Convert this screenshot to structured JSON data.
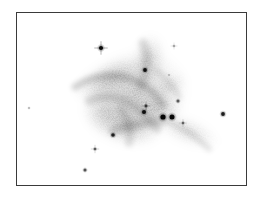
{
  "figure": {
    "kind": "astronomical-plate",
    "rendering": "inverted-grayscale",
    "background_color": "#ffffff",
    "ink_color": "#000000",
    "frame": {
      "border_color": "#3a3a3a",
      "shadow_color": "#8a8a8a",
      "x": 16,
      "y": 12,
      "width": 231,
      "height": 174
    }
  },
  "chart_data": {
    "type": "scatter",
    "title": "",
    "subtitle": "",
    "xlabel": "",
    "ylabel": "",
    "grid": false,
    "legend": null,
    "axis_visible": false,
    "tick_labels": [],
    "xlim": [
      0,
      231
    ],
    "ylim": [
      0,
      174
    ],
    "colormap": "grayscale-inverted",
    "note": "Diffuse nebulosity plus discrete point sources on a photographic plate; darker ink = brighter sky flux.",
    "series": [
      {
        "name": "point-sources",
        "marker": "filled-dot",
        "points": [
          {
            "id": "s01",
            "x": 84,
            "y": 35,
            "r": 2.1,
            "darkness": 0.92,
            "spikes": true,
            "label": "star-upper-left"
          },
          {
            "id": "s02",
            "x": 157,
            "y": 33,
            "r": 1.1,
            "darkness": 0.28,
            "spikes": true,
            "label": "star-upper-right-faint"
          },
          {
            "id": "s03",
            "x": 128,
            "y": 57,
            "r": 1.9,
            "darkness": 0.9,
            "spikes": false,
            "label": "star-upper-mid"
          },
          {
            "id": "s04",
            "x": 129,
            "y": 93,
            "r": 1.4,
            "darkness": 0.6,
            "spikes": true,
            "label": "star-core-a"
          },
          {
            "id": "s05",
            "x": 127,
            "y": 99,
            "r": 2.0,
            "darkness": 0.9,
            "spikes": false,
            "label": "star-core-b"
          },
          {
            "id": "s06",
            "x": 146,
            "y": 104,
            "r": 2.6,
            "darkness": 0.96,
            "spikes": false,
            "label": "star-bright-pair-left"
          },
          {
            "id": "s07",
            "x": 155,
            "y": 104,
            "r": 2.5,
            "darkness": 0.95,
            "spikes": false,
            "label": "star-bright-pair-right"
          },
          {
            "id": "s08",
            "x": 166,
            "y": 110,
            "r": 1.2,
            "darkness": 0.45,
            "spikes": true,
            "label": "star-right-of-pair"
          },
          {
            "id": "s09",
            "x": 161,
            "y": 88,
            "r": 1.5,
            "darkness": 0.55,
            "spikes": false,
            "label": "star-mid-right"
          },
          {
            "id": "s10",
            "x": 206,
            "y": 101,
            "r": 1.9,
            "darkness": 0.85,
            "spikes": false,
            "label": "star-far-right"
          },
          {
            "id": "s11",
            "x": 96,
            "y": 122,
            "r": 1.8,
            "darkness": 0.82,
            "spikes": false,
            "label": "star-lower-center"
          },
          {
            "id": "s12",
            "x": 78,
            "y": 136,
            "r": 1.3,
            "darkness": 0.5,
            "spikes": true,
            "label": "star-lower-left-a"
          },
          {
            "id": "s13",
            "x": 68,
            "y": 157,
            "r": 1.5,
            "darkness": 0.6,
            "spikes": false,
            "label": "star-lower-left-b"
          },
          {
            "id": "s14",
            "x": 12,
            "y": 95,
            "r": 1.0,
            "darkness": 0.25,
            "spikes": false,
            "label": "star-far-left-faint"
          },
          {
            "id": "s15",
            "x": 152,
            "y": 62,
            "r": 0.9,
            "darkness": 0.22,
            "spikes": false,
            "label": "star-faint-upper"
          }
        ]
      },
      {
        "name": "nebulosity",
        "marker": "diffuse-cloud",
        "regions": [
          {
            "id": "n1",
            "cx": 118,
            "cy": 82,
            "rx": 56,
            "ry": 46,
            "rot": -18,
            "opacity": 0.34,
            "label": "main-cloud"
          },
          {
            "id": "n2",
            "cx": 92,
            "cy": 66,
            "rx": 40,
            "ry": 17,
            "rot": -24,
            "opacity": 0.3,
            "label": "nw-filament"
          },
          {
            "id": "n3",
            "cx": 132,
            "cy": 46,
            "rx": 17,
            "ry": 27,
            "rot": 8,
            "opacity": 0.24,
            "label": "north-plume"
          },
          {
            "id": "n4",
            "cx": 110,
            "cy": 112,
            "rx": 38,
            "ry": 22,
            "rot": 12,
            "opacity": 0.3,
            "label": "south-cloud"
          },
          {
            "id": "n5",
            "cx": 170,
            "cy": 118,
            "rx": 36,
            "ry": 14,
            "rot": 22,
            "opacity": 0.2,
            "label": "se-streamer"
          },
          {
            "id": "n6",
            "cx": 140,
            "cy": 96,
            "rx": 26,
            "ry": 16,
            "rot": -6,
            "opacity": 0.26,
            "label": "core-halo"
          },
          {
            "id": "n7",
            "cx": 86,
            "cy": 98,
            "rx": 22,
            "ry": 24,
            "rot": 0,
            "opacity": 0.18,
            "label": "west-wisp"
          },
          {
            "id": "n8",
            "cx": 152,
            "cy": 74,
            "rx": 20,
            "ry": 12,
            "rot": -34,
            "opacity": 0.16,
            "label": "ne-wisp"
          }
        ]
      }
    ]
  }
}
